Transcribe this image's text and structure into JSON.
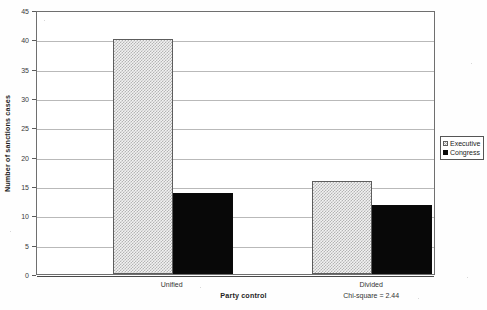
{
  "chart_data": {
    "type": "bar",
    "title": "",
    "subtitle": "",
    "xlabel": "Party control",
    "ylabel": "Number of sanctions cases",
    "categories": [
      "Unified",
      "Divided"
    ],
    "series": [
      {
        "name": "Executive",
        "values": [
          40,
          15.8
        ],
        "color": "#f2f2f2",
        "pattern": "fine-checker",
        "edge_color": "#5d5d5d"
      },
      {
        "name": "Congress",
        "values": [
          13.8,
          11.7
        ],
        "color": "#080808",
        "pattern": "solid",
        "edge_color": "#0a0a0a"
      }
    ],
    "ylim": [
      0,
      45
    ],
    "ytick_step": 5,
    "yticks": [
      0,
      5,
      10,
      15,
      20,
      25,
      30,
      35,
      40,
      45
    ],
    "ytick_labels": [
      "0",
      "5",
      "10",
      "15",
      "20",
      "25",
      "30",
      "35",
      "40",
      "45"
    ],
    "grid": true,
    "grid_axis": "y",
    "legend": {
      "position": "right",
      "entries": [
        "Executive",
        "Congress"
      ]
    },
    "annotations": [
      {
        "text": "Chi-square = 2.44",
        "near_category": "Divided",
        "placement": "below-axis"
      }
    ]
  },
  "axes": {
    "y_title": "Number of sanctions cases",
    "x_title": "Party control"
  },
  "legend": {
    "entries": [
      {
        "label": "Executive"
      },
      {
        "label": "Congress"
      }
    ]
  },
  "annotation": {
    "chi_square": "Chi-square = 2.44"
  }
}
